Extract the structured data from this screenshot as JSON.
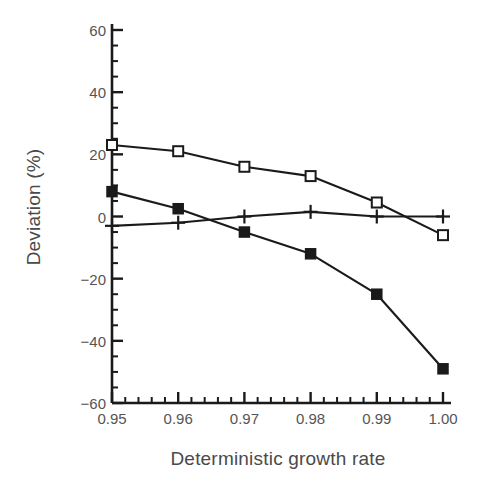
{
  "chart_data": {
    "type": "line",
    "title": "",
    "subtitle": "",
    "xlabel": "Deterministic growth rate",
    "ylabel": "Deviation (%)",
    "x": [
      0.95,
      0.96,
      0.97,
      0.98,
      0.99,
      1.0
    ],
    "xlim": [
      0.95,
      1.0
    ],
    "ylim": [
      -60,
      60
    ],
    "x_tick_labels": [
      "0.95",
      "0.96",
      "0.97",
      "0.98",
      "0.99",
      "1.00"
    ],
    "x_major_step": 0.01,
    "x_minor_step": 0.002,
    "y_tick_labels": [
      "60",
      "40",
      "20",
      "0",
      "-20",
      "-40",
      "-60"
    ],
    "y_tick_values": [
      60,
      40,
      20,
      0,
      -20,
      -40,
      -60
    ],
    "y_major_step": 20,
    "y_minor_step": 5,
    "grid": false,
    "legend": "none",
    "series": [
      {
        "name": "open-square-series",
        "marker": "open-square",
        "color": "#1a1a1a",
        "values": [
          23,
          21,
          16,
          13,
          4.5,
          -6
        ]
      },
      {
        "name": "filled-square-series",
        "marker": "filled-square",
        "color": "#1a1a1a",
        "values": [
          8,
          2.5,
          -5,
          -12,
          -25,
          -49
        ]
      },
      {
        "name": "plus-series",
        "marker": "plus",
        "color": "#1a1a1a",
        "values": [
          -3,
          -2,
          0,
          1.5,
          0,
          0
        ]
      }
    ]
  },
  "axis": {
    "ylabel": "Deviation (%)",
    "xlabel": "Deterministic growth rate"
  }
}
